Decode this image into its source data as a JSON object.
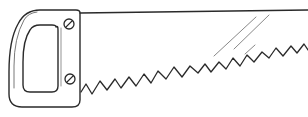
{
  "image": {
    "subject": "hand saw line drawing",
    "stroke_color": "#2a2a2a",
    "highlight_color": "#7a7a7a",
    "background": "#ffffff"
  },
  "parts": {
    "handle": {
      "label": "saw handle",
      "screws": 2
    },
    "blade": {
      "label": "saw blade",
      "teeth_count": 16
    },
    "highlights": 3
  }
}
